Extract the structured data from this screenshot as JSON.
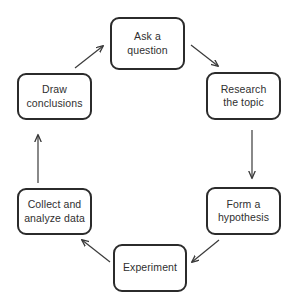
{
  "diagram": {
    "type": "cycle-flowchart",
    "background_color": "#ffffff",
    "node_border_color": "#2b2b2b",
    "node_fill_color": "#ffffff",
    "text_color": "#2f2f2f",
    "arrow_color": "#3a3a3a",
    "nodes": [
      {
        "id": "ask",
        "label": "Ask a\nquestion",
        "x": 110,
        "y": 17,
        "w": 75,
        "h": 53
      },
      {
        "id": "research",
        "label": "Research\nthe topic",
        "x": 206,
        "y": 72,
        "w": 75,
        "h": 48
      },
      {
        "id": "form",
        "label": "Form a\nhypothesis",
        "x": 206,
        "y": 187,
        "w": 75,
        "h": 48
      },
      {
        "id": "experiment",
        "label": "Experiment",
        "x": 113,
        "y": 244,
        "w": 74,
        "h": 48
      },
      {
        "id": "collect",
        "label": "Collect and\nanalyze data",
        "x": 17,
        "y": 188,
        "w": 75,
        "h": 47
      },
      {
        "id": "draw",
        "label": "Draw\nconclusions",
        "x": 17,
        "y": 73,
        "w": 75,
        "h": 47
      }
    ],
    "edges": [
      {
        "id": "ask-to-research",
        "from": "ask",
        "to": "research",
        "direction": "down-right"
      },
      {
        "id": "research-to-form",
        "from": "research",
        "to": "form",
        "direction": "down"
      },
      {
        "id": "form-to-experiment",
        "from": "form",
        "to": "experiment",
        "direction": "down-left"
      },
      {
        "id": "experiment-to-collect",
        "from": "experiment",
        "to": "collect",
        "direction": "up-left"
      },
      {
        "id": "collect-to-draw",
        "from": "collect",
        "to": "draw",
        "direction": "up"
      },
      {
        "id": "draw-to-ask",
        "from": "draw",
        "to": "ask",
        "direction": "up-right"
      }
    ]
  }
}
